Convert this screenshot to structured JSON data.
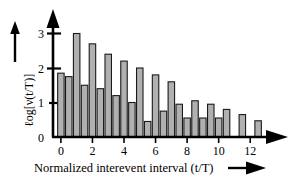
{
  "figure": {
    "background_color": "#ffffff",
    "ink_color": "#000000",
    "bar_fill_color": "#b0b0b0",
    "bar_edge_color": "#1a1a1a"
  },
  "chart_data": {
    "type": "bar",
    "title": "",
    "subtitle": "",
    "xlabel": "Normalized interevent interval (t/T)",
    "ylabel": "ℓog[ν(t/T)]",
    "ylabel_parts": {
      "prefix": "ℓog[",
      "symbol": "ν",
      "arg": "(t/T)",
      "suffix": "]"
    },
    "xlim": [
      -0.5,
      13.0
    ],
    "ylim": [
      0,
      3.25
    ],
    "xticks": [
      0,
      2,
      4,
      6,
      8,
      10,
      12
    ],
    "xticklabels": [
      "0",
      "2",
      "4",
      "6",
      "8",
      "10",
      "12"
    ],
    "yticks": [
      0,
      1,
      2,
      3
    ],
    "yticklabels": [
      "0",
      "1",
      "2",
      "3"
    ],
    "grid": false,
    "legend": null,
    "legend_position": "none",
    "x_axis_arrow": true,
    "y_axis_arrow": true,
    "xlabel_arrow": true,
    "ylabel_arrow": true,
    "bar_width": 0.46,
    "x": [
      0.0,
      0.5,
      1.0,
      1.5,
      2.0,
      2.5,
      3.0,
      3.5,
      4.0,
      4.5,
      5.0,
      5.5,
      6.0,
      6.5,
      7.0,
      7.5,
      8.0,
      8.5,
      9.0,
      9.5,
      10.0,
      10.5,
      11.0,
      11.5,
      12.0,
      12.5
    ],
    "values": [
      1.85,
      1.75,
      3.0,
      1.5,
      2.7,
      1.4,
      2.4,
      1.2,
      2.2,
      1.0,
      2.0,
      0.45,
      1.8,
      0.75,
      1.6,
      0.95,
      0.55,
      1.05,
      0.55,
      0.95,
      0.55,
      0.8,
      0.0,
      0.65,
      0.0,
      0.47
    ],
    "categories": [
      "0.0",
      "0.5",
      "1.0",
      "1.5",
      "2.0",
      "2.5",
      "3.0",
      "3.5",
      "4.0",
      "4.5",
      "5.0",
      "5.5",
      "6.0",
      "6.5",
      "7.0",
      "7.5",
      "8.0",
      "8.5",
      "9.0",
      "9.5",
      "10.0",
      "10.5",
      "11.0",
      "11.5",
      "12.0",
      "12.5"
    ]
  }
}
